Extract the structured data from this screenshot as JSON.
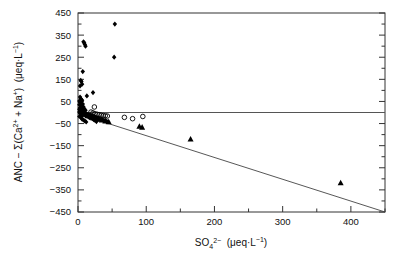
{
  "chart_data": {
    "type": "scatter",
    "title": "",
    "xlabel": "SO4 2- (ueq.L-1)",
    "ylabel": "ANC - S(Ca2+ + Na+)  (ueq.L-1)",
    "xlim": [
      0,
      450
    ],
    "ylim": [
      -450,
      450
    ],
    "xticks": [
      0,
      100,
      200,
      300,
      400
    ],
    "xtick_labels": [
      "0",
      "100",
      "200",
      "300",
      "400"
    ],
    "xminor_ticks": [
      50,
      150,
      250,
      350,
      450
    ],
    "yticks": [
      450,
      350,
      250,
      150,
      50,
      -50,
      -150,
      -250,
      -350,
      -450
    ],
    "ytick_labels": [
      "450",
      "350",
      "250",
      "150",
      "50",
      "-50",
      "-150",
      "-250",
      "-350",
      "-450"
    ],
    "yminor_ticks": [
      400,
      300,
      200,
      100,
      0,
      -100,
      -200,
      -300,
      -400
    ],
    "grid": false,
    "legend": "none",
    "reference_lines": [
      {
        "name": "zero-line",
        "type": "horizontal",
        "y": 0,
        "x_from": 0,
        "x_to": 450,
        "color": "#555555"
      },
      {
        "name": "regression-line",
        "type": "segment",
        "x1": 2,
        "y1": -8,
        "x2": 450,
        "y2": -450,
        "color": "#444444"
      }
    ],
    "series": [
      {
        "name": "filled-diamond",
        "marker": "diamond",
        "fill": "#000000",
        "points": [
          [
            54,
            400
          ],
          [
            53,
            250
          ],
          [
            8,
            320
          ],
          [
            9,
            315
          ],
          [
            10,
            308
          ],
          [
            11,
            300
          ],
          [
            7,
            185
          ],
          [
            4,
            145
          ],
          [
            5,
            140
          ],
          [
            6,
            128
          ],
          [
            3,
            120
          ],
          [
            22,
            90
          ],
          [
            13,
            75
          ],
          [
            3,
            70
          ],
          [
            4,
            62
          ],
          [
            5,
            58
          ],
          [
            6,
            55
          ],
          [
            2,
            52
          ],
          [
            3,
            45
          ],
          [
            5,
            40
          ],
          [
            7,
            38
          ],
          [
            2,
            35
          ],
          [
            4,
            30
          ],
          [
            6,
            28
          ],
          [
            8,
            25
          ],
          [
            3,
            22
          ],
          [
            5,
            20
          ],
          [
            9,
            18
          ],
          [
            2,
            15
          ],
          [
            4,
            12
          ],
          [
            6,
            10
          ],
          [
            11,
            10
          ],
          [
            3,
            8
          ],
          [
            7,
            6
          ],
          [
            5,
            4
          ],
          [
            2,
            2
          ],
          [
            8,
            2
          ],
          [
            4,
            0
          ],
          [
            10,
            -2
          ],
          [
            6,
            -4
          ],
          [
            3,
            -5
          ],
          [
            12,
            -6
          ],
          [
            14,
            -8
          ],
          [
            9,
            -9
          ],
          [
            16,
            -10
          ],
          [
            5,
            -11
          ],
          [
            18,
            -12
          ],
          [
            7,
            -13
          ],
          [
            20,
            -14
          ],
          [
            11,
            -15
          ],
          [
            22,
            -16
          ],
          [
            13,
            -17
          ],
          [
            2,
            -18
          ],
          [
            24,
            -19
          ],
          [
            15,
            -20
          ],
          [
            4,
            -21
          ],
          [
            26,
            -22
          ],
          [
            17,
            -23
          ],
          [
            28,
            -24
          ],
          [
            19,
            -25
          ],
          [
            30,
            -27
          ],
          [
            21,
            -28
          ],
          [
            32,
            -29
          ],
          [
            6,
            -30
          ],
          [
            34,
            -31
          ],
          [
            23,
            -32
          ],
          [
            36,
            -33
          ],
          [
            8,
            -34
          ],
          [
            38,
            -35
          ],
          [
            25,
            -36
          ],
          [
            40,
            -37
          ],
          [
            10,
            -38
          ],
          [
            42,
            -40
          ],
          [
            27,
            -41
          ],
          [
            44,
            -42
          ],
          [
            12,
            -43
          ]
        ]
      },
      {
        "name": "open-circle",
        "marker": "circle",
        "fill": "none",
        "stroke": "#000000",
        "points": [
          [
            24,
            25
          ],
          [
            19,
            2
          ],
          [
            22,
            -2
          ],
          [
            25,
            -6
          ],
          [
            28,
            -8
          ],
          [
            31,
            -10
          ],
          [
            34,
            -12
          ],
          [
            37,
            -14
          ],
          [
            40,
            -15
          ],
          [
            43,
            -16
          ],
          [
            68,
            -22
          ],
          [
            80,
            -28
          ],
          [
            95,
            -18
          ]
        ]
      },
      {
        "name": "filled-triangle",
        "marker": "triangle",
        "fill": "#000000",
        "points": [
          [
            30,
            -30
          ],
          [
            35,
            -34
          ],
          [
            40,
            -38
          ],
          [
            45,
            -42
          ],
          [
            90,
            -62
          ],
          [
            94,
            -66
          ],
          [
            165,
            -120
          ],
          [
            385,
            -318
          ]
        ]
      }
    ]
  }
}
